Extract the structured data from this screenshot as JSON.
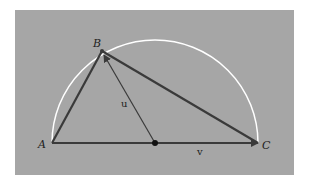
{
  "figure": {
    "background": "#a6a6a6",
    "arc_color": "#ffffff",
    "line_color": "#3a3a3a",
    "points": {
      "A": {
        "label": "A",
        "x": 52,
        "y": 143
      },
      "B": {
        "label": "B",
        "x": 102,
        "y": 51
      },
      "C": {
        "label": "C",
        "x": 258,
        "y": 143
      },
      "O": {
        "x": 155,
        "y": 143
      }
    },
    "vectors": {
      "u": {
        "label": "u"
      },
      "v": {
        "label": "v"
      }
    }
  }
}
